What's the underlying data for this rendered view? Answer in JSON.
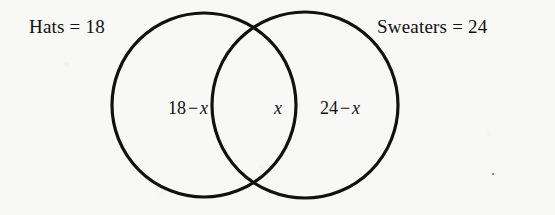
{
  "diagram": {
    "type": "venn-two-set",
    "background_color": "#f8f8f6",
    "stroke_color": "#111111",
    "sets": [
      {
        "id": "hats",
        "name": "Hats",
        "label": "Hats = 18",
        "total": 18,
        "center": [
          204,
          105
        ],
        "radius": 92
      },
      {
        "id": "sweaters",
        "name": "Sweaters",
        "label": "Sweaters = 24",
        "total": 24,
        "center": [
          305,
          105
        ],
        "radius": 93
      }
    ],
    "regions": [
      {
        "id": "left-only",
        "description": "Hats only",
        "expression": "18 − x",
        "number": "18",
        "operator": "−",
        "variable": "x"
      },
      {
        "id": "intersection",
        "description": "Both hats and sweaters",
        "expression": "x",
        "variable": "x"
      },
      {
        "id": "right-only",
        "description": "Sweaters only",
        "expression": "24 − x",
        "number": "24",
        "operator": "−",
        "variable": "x"
      }
    ]
  }
}
